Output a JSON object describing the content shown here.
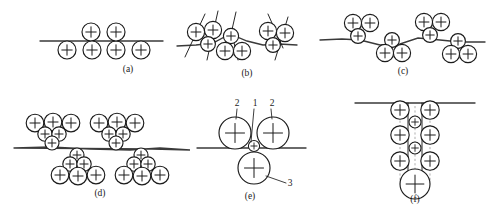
{
  "figure": {
    "background_color": "#ffffff",
    "ink_color": "#1b1b1b",
    "surface_color": "#3a3a3a",
    "particle_fill": "#ffffff",
    "panels": [
      {
        "id": "a",
        "label": "(a)",
        "label_x": 128,
        "label_y": 72,
        "surface": "M 40 41 L 163 41",
        "particles": [
          {
            "cx": 67,
            "cy": 50,
            "r": 9.0
          },
          {
            "cx": 91,
            "cy": 32,
            "r": 9.0
          },
          {
            "cx": 92,
            "cy": 50,
            "r": 9.0
          },
          {
            "cx": 116,
            "cy": 50,
            "r": 9.0
          },
          {
            "cx": 116,
            "cy": 32,
            "r": 9.0
          },
          {
            "cx": 141,
            "cy": 50,
            "r": 9.0
          }
        ]
      },
      {
        "id": "b",
        "label": "(b)",
        "label_x": 247,
        "label_y": 76,
        "surface": "M 177 46 L 196 45 L 213 43 L 230 34 L 247 41 L 263 45 L 279 44 L 297 45",
        "cracks": [
          "M 185 57 L 205 14",
          "M 207 60 L 218 11",
          "M 236 12 L 231 34",
          "M 232 34 L 238 60",
          "M 268 14 L 283 48",
          "M 275 60 L 288 17"
        ],
        "particles": [
          {
            "cx": 196,
            "cy": 32,
            "r": 8.6
          },
          {
            "cx": 213,
            "cy": 30,
            "r": 8.6
          },
          {
            "cx": 208,
            "cy": 44,
            "r": 7.4
          },
          {
            "cx": 231,
            "cy": 36,
            "r": 7.6
          },
          {
            "cx": 225,
            "cy": 51,
            "r": 8.6
          },
          {
            "cx": 242,
            "cy": 51,
            "r": 8.6
          },
          {
            "cx": 268,
            "cy": 31,
            "r": 8.6
          },
          {
            "cx": 285,
            "cy": 33,
            "r": 8.6
          },
          {
            "cx": 273,
            "cy": 45,
            "r": 7.4
          }
        ]
      },
      {
        "id": "c",
        "label": "(c)",
        "label_x": 403,
        "label_y": 74,
        "surface": "M 320 40 L 342 39 L 360 40 L 380 45 L 400 44 L 418 38 L 440 40 L 460 42 L 485 42",
        "particles": [
          {
            "cx": 353,
            "cy": 23,
            "r": 8.6
          },
          {
            "cx": 370,
            "cy": 23,
            "r": 8.6
          },
          {
            "cx": 358,
            "cy": 36,
            "r": 7.4
          },
          {
            "cx": 392,
            "cy": 40,
            "r": 7.4
          },
          {
            "cx": 385,
            "cy": 53,
            "r": 8.6
          },
          {
            "cx": 402,
            "cy": 53,
            "r": 8.6
          },
          {
            "cx": 424,
            "cy": 22,
            "r": 8.6
          },
          {
            "cx": 441,
            "cy": 22,
            "r": 8.6
          },
          {
            "cx": 430,
            "cy": 35,
            "r": 7.4
          },
          {
            "cx": 458,
            "cy": 41,
            "r": 7.4
          },
          {
            "cx": 451,
            "cy": 54,
            "r": 8.6
          },
          {
            "cx": 468,
            "cy": 54,
            "r": 8.6
          }
        ]
      },
      {
        "id": "d",
        "label": "(d)",
        "label_x": 100,
        "label_y": 196,
        "surface": "M 14 148 L 50 147 L 90 149 L 130 150 L 160 148 L 190 150 L 152 149 L 14 148",
        "particles": [
          {
            "cx": 35,
            "cy": 123,
            "r": 8.8
          },
          {
            "cx": 53,
            "cy": 122,
            "r": 8.8
          },
          {
            "cx": 71,
            "cy": 123,
            "r": 8.8
          },
          {
            "cx": 45,
            "cy": 134,
            "r": 7.2
          },
          {
            "cx": 59,
            "cy": 134,
            "r": 7.2
          },
          {
            "cx": 52,
            "cy": 143,
            "r": 7.0
          },
          {
            "cx": 99,
            "cy": 123,
            "r": 8.8
          },
          {
            "cx": 117,
            "cy": 122,
            "r": 8.8
          },
          {
            "cx": 135,
            "cy": 123,
            "r": 8.8
          },
          {
            "cx": 109,
            "cy": 134,
            "r": 7.2
          },
          {
            "cx": 123,
            "cy": 134,
            "r": 7.2
          },
          {
            "cx": 116,
            "cy": 143,
            "r": 7.0
          },
          {
            "cx": 77,
            "cy": 155,
            "r": 7.0
          },
          {
            "cx": 70,
            "cy": 164,
            "r": 7.2
          },
          {
            "cx": 84,
            "cy": 164,
            "r": 7.2
          },
          {
            "cx": 60,
            "cy": 175,
            "r": 8.8
          },
          {
            "cx": 78,
            "cy": 176,
            "r": 8.8
          },
          {
            "cx": 96,
            "cy": 175,
            "r": 8.8
          },
          {
            "cx": 141,
            "cy": 155,
            "r": 7.0
          },
          {
            "cx": 134,
            "cy": 164,
            "r": 7.2
          },
          {
            "cx": 148,
            "cy": 164,
            "r": 7.2
          },
          {
            "cx": 124,
            "cy": 175,
            "r": 8.8
          },
          {
            "cx": 142,
            "cy": 176,
            "r": 8.8
          },
          {
            "cx": 160,
            "cy": 175,
            "r": 8.8
          }
        ]
      },
      {
        "id": "e",
        "label": "(e)",
        "label_x": 250,
        "label_y": 199,
        "surface": "M 197 148 L 306 148",
        "particles": [
          {
            "cx": 235,
            "cy": 133,
            "r": 16.0
          },
          {
            "cx": 273,
            "cy": 133,
            "r": 16.0
          },
          {
            "cx": 254,
            "cy": 146,
            "r": 5.6
          },
          {
            "cx": 254,
            "cy": 168,
            "r": 16.0
          }
        ],
        "callouts": [
          {
            "text": "2",
            "x": 237,
            "y": 106,
            "leader": "M 237 109 L 236 119"
          },
          {
            "text": "1",
            "x": 255,
            "y": 106,
            "leader": "M 254 109 L 251 142"
          },
          {
            "text": "2",
            "x": 272,
            "y": 106,
            "leader": "M 271 109 L 272 119"
          },
          {
            "text": "3",
            "x": 290,
            "y": 186,
            "leader": "M 286 183 L 266 176"
          }
        ]
      },
      {
        "id": "f",
        "label": "(f)",
        "label_x": 415,
        "label_y": 202,
        "surface": "M 355 103 L 475 103",
        "column_guides": [
          "M 400 103 L 400 180",
          "M 430 103 L 430 180",
          "M 415 106 L 415 178"
        ],
        "crack_walls": [
          "M 408 103 L 408 175 L 415 182",
          "M 422 103 L 422 175 L 415 182"
        ],
        "particles": [
          {
            "cx": 400,
            "cy": 110,
            "r": 9.2
          },
          {
            "cx": 430,
            "cy": 110,
            "r": 9.2
          },
          {
            "cx": 415,
            "cy": 122,
            "r": 6.0
          },
          {
            "cx": 400,
            "cy": 135,
            "r": 9.2
          },
          {
            "cx": 430,
            "cy": 135,
            "r": 9.2
          },
          {
            "cx": 415,
            "cy": 148,
            "r": 6.0
          },
          {
            "cx": 400,
            "cy": 161,
            "r": 9.2
          },
          {
            "cx": 430,
            "cy": 161,
            "r": 9.2
          },
          {
            "cx": 415,
            "cy": 184,
            "r": 15.0
          }
        ]
      }
    ]
  }
}
